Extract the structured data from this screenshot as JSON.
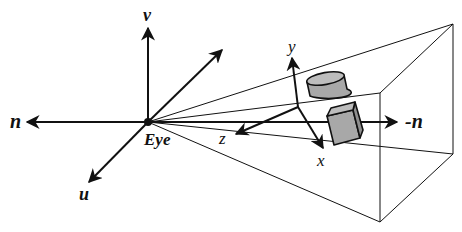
{
  "diagram": {
    "labels": {
      "eye": "Eye",
      "u": "u",
      "v": "v",
      "n": "n",
      "neg_n": "-n",
      "x": "x",
      "y": "y",
      "z": "z"
    },
    "objects": [
      {
        "name": "cylinder",
        "shape": "cylinder"
      },
      {
        "name": "cube",
        "shape": "box"
      }
    ],
    "colors": {
      "stroke": "#111111",
      "object_fill": "#a8a8a8",
      "object_top": "#bdbdbd",
      "background": "#ffffff"
    }
  }
}
